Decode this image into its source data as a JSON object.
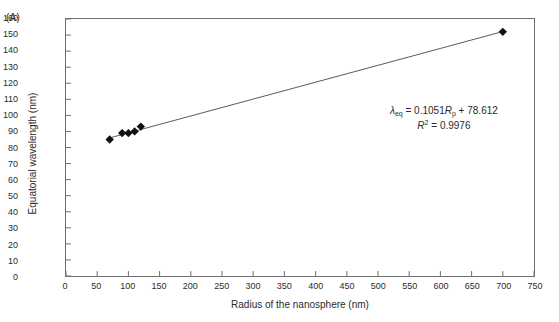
{
  "panel": {
    "label": "(A)"
  },
  "chart_data": {
    "type": "scatter",
    "title": "",
    "xlabel": "Radius of the nanosphere (nm)",
    "ylabel": "Equatorial wavelength (nm)",
    "xlim": [
      0,
      750
    ],
    "ylim": [
      0,
      160
    ],
    "xticks": [
      0,
      50,
      100,
      150,
      200,
      250,
      300,
      350,
      400,
      450,
      500,
      550,
      600,
      650,
      700,
      750
    ],
    "yticks": [
      0,
      10,
      20,
      30,
      40,
      50,
      60,
      70,
      80,
      90,
      100,
      110,
      120,
      130,
      140,
      150,
      160
    ],
    "grid": false,
    "legend": null,
    "marker": "filled-diamond",
    "marker_color": "#111111",
    "line_color": "#5a5a5a",
    "series": [
      {
        "name": "Equatorial wavelength vs radius",
        "points": [
          {
            "x": 70,
            "y": 85
          },
          {
            "x": 90,
            "y": 89
          },
          {
            "x": 100,
            "y": 89
          },
          {
            "x": 110,
            "y": 90
          },
          {
            "x": 120,
            "y": 93
          },
          {
            "x": 700,
            "y": 152
          }
        ]
      }
    ],
    "trendline": {
      "type": "linear",
      "slope": 0.1051,
      "intercept": 78.612,
      "r_squared": 0.9976,
      "x_start": 70,
      "x_end": 700
    },
    "annotations": {
      "equation_lambda": "λ",
      "equation_lambda_sub": "eq",
      "equation_mid": " = 0.1051",
      "equation_var": "R",
      "equation_var_sub": "p",
      "equation_tail": " + 78.612",
      "r2_var": "R",
      "r2_sup": "2",
      "r2_value": " = 0.9976"
    }
  }
}
